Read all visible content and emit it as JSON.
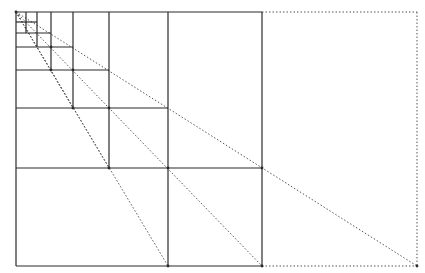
{
  "diagram": {
    "title": "",
    "colors": {
      "solid": "#2a2a2a",
      "dotted": "#555555",
      "background": "#ffffff"
    },
    "origin": [
      16,
      12
    ],
    "outer_rect": {
      "x1": 16,
      "y1": 12,
      "x2": 417,
      "y2": 266
    },
    "main_square": {
      "x1": 16,
      "y1": 12,
      "x2": 262,
      "y2": 266
    },
    "vertical_lines_x": [
      26,
      37,
      51,
      73,
      109,
      168,
      262
    ],
    "horizontal_lines_y": [
      22,
      33,
      47,
      70,
      108,
      168,
      266
    ],
    "diagonal_endpoints": [
      [
        417,
        266
      ],
      [
        262,
        266
      ],
      [
        168,
        266
      ]
    ]
  }
}
